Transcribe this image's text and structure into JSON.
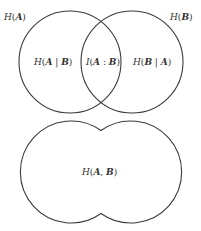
{
  "diagram": {
    "type": "venn-entropy",
    "venn": {
      "circle_a": {
        "cx": 70,
        "cy": 62,
        "r": 51,
        "label": "H(A)"
      },
      "circle_b": {
        "cx": 132,
        "cy": 62,
        "r": 51,
        "label": "H(B)"
      },
      "regions": {
        "a_given_b": "H(A | B)",
        "mutual": "I(A : B)",
        "b_given_a": "H(B | A)"
      }
    },
    "union": {
      "label": "H(A, B)"
    },
    "stroke_color": "#3a3a3a",
    "text_color": "#333333"
  },
  "labels": {
    "h_a": {
      "H": "H",
      "open": "(",
      "var": "A",
      "close": ")"
    },
    "h_b": {
      "H": "H",
      "open": "(",
      "var": "B",
      "close": ")"
    },
    "h_a_given_b": {
      "H": "H",
      "open": "(",
      "v1": "A",
      "sep": " | ",
      "v2": "B",
      "close": ")"
    },
    "i_ab": {
      "I": "I",
      "open": "(",
      "v1": "A",
      "sep": " : ",
      "v2": "B",
      "close": ")"
    },
    "h_b_given_a": {
      "H": "H",
      "open": "(",
      "v1": "B",
      "sep": " | ",
      "v2": "A",
      "close": ")"
    },
    "h_ab": {
      "H": "H",
      "open": "(",
      "v1": "A",
      "sep": ", ",
      "v2": "B",
      "close": ")"
    }
  }
}
